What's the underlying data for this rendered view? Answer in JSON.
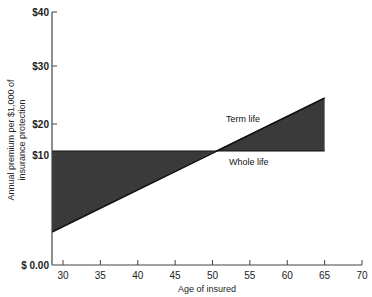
{
  "chart_data": {
    "type": "line",
    "title": "",
    "xlabel": "Age of insured",
    "ylabel": "Annual premium per $1,000 of insurance protection",
    "ylabel_lines": [
      "Annual premium per $1,000 of",
      "insurance protection"
    ],
    "xlim": [
      28,
      70
    ],
    "ylim": [
      0,
      40
    ],
    "x_ticks": [
      30,
      35,
      40,
      45,
      50,
      55,
      60,
      65,
      70
    ],
    "y_ticks": [
      {
        "value": 0,
        "label": "$ 0.00"
      },
      {
        "value": 10,
        "label": "$10"
      },
      {
        "value": 20,
        "label": "$20"
      },
      {
        "value": 30,
        "label": "$30"
      },
      {
        "value": 40,
        "label": "$40"
      }
    ],
    "grid": false,
    "series": [
      {
        "name": "Term life",
        "x": [
          28,
          65
        ],
        "values": [
          4,
          24.5
        ]
      },
      {
        "name": "Whole life",
        "x": [
          28,
          65
        ],
        "values": [
          11,
          11
        ]
      }
    ],
    "shaded_regions": [
      {
        "between": [
          "Whole life",
          "Term life"
        ],
        "x_range": [
          28,
          43.5
        ],
        "color": "#3a3a3a"
      },
      {
        "between": [
          "Term life",
          "Whole life"
        ],
        "x_range": [
          43.5,
          65
        ],
        "color": "#3a3a3a"
      }
    ],
    "crossover_age": 43.5,
    "annotations": [
      {
        "text": "Term life",
        "x": 52,
        "y": 21
      },
      {
        "text": "Whole life",
        "x": 55,
        "y": 10
      }
    ]
  },
  "colors": {
    "fill": "#3a3a3a",
    "axis": "#444444"
  }
}
